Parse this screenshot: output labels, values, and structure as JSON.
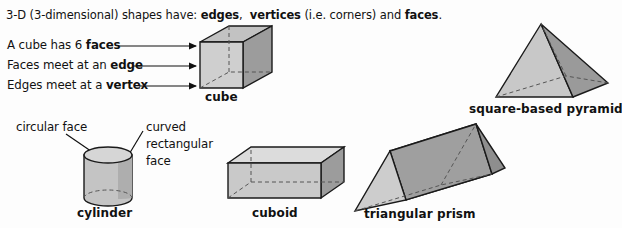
{
  "page": {
    "width": 622,
    "height": 228,
    "background": "#fdfdfd",
    "ink": "#111111"
  },
  "intro": {
    "part1": "3-D (3-dimensional) shapes have: ",
    "bold1": "edges",
    "part2": ",  ",
    "bold2": "vertices",
    "part3": " (i.e. corners) and ",
    "bold3": "faces",
    "part4": "."
  },
  "cube_callouts": [
    {
      "plain_before": "A cube has 6 ",
      "bold": "faces",
      "plain_after": ""
    },
    {
      "plain_before": "Faces meet at an ",
      "bold": "edge",
      "plain_after": ""
    },
    {
      "plain_before": "Edges meet at a ",
      "bold": "vertex",
      "plain_after": ""
    }
  ],
  "cylinder_callouts": {
    "circular": "circular face",
    "curved_line1": "curved",
    "curved_line2": "rectangular",
    "curved_line3": "face"
  },
  "shapes": [
    {
      "id": "cube",
      "label": "cube"
    },
    {
      "id": "square-based-pyramid",
      "label": "square-based pyramid"
    },
    {
      "id": "cylinder",
      "label": "cylinder"
    },
    {
      "id": "cuboid",
      "label": "cuboid"
    },
    {
      "id": "triangular-prism",
      "label": "triangular prism"
    }
  ],
  "colors": {
    "face_light": "#cfcfcf",
    "face_mid": "#b8b8b8",
    "face_dark": "#9c9c9c",
    "face_darker": "#8e8e8e",
    "outline": "#1a1a1a",
    "hidden_edge": "#4a4a4a"
  }
}
